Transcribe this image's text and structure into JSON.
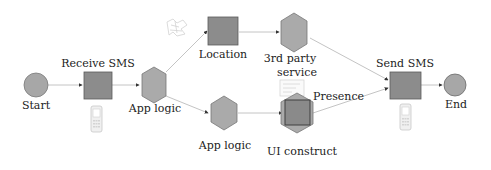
{
  "colors": {
    "node_fill": "#a9a9a9",
    "node_stroke": "#6e6e6e",
    "square_fill": "#8a8a8a",
    "square_stroke": "#555555",
    "edge": "#bfbfbf",
    "text": "#222222"
  },
  "nodes": {
    "start": {
      "label": "Start",
      "shape": "circle"
    },
    "receive_sms": {
      "label": "Receive SMS",
      "shape": "square",
      "icon": "mobile-phone-icon"
    },
    "app_logic_1": {
      "label": "App logic",
      "shape": "hexagon"
    },
    "location": {
      "label": "Location",
      "shape": "square",
      "icon": "map-icon"
    },
    "third_party": {
      "label_line1": "3rd party",
      "label_line2": "service",
      "shape": "hexagon"
    },
    "app_logic_2": {
      "label": "App logic",
      "shape": "hexagon"
    },
    "ui_construct": {
      "label": "UI construct",
      "shape": "hexagon-with-square",
      "annotation": "Presence",
      "icon": "presence-card-icon"
    },
    "send_sms": {
      "label": "Send SMS",
      "shape": "square",
      "icon": "mobile-phone-icon"
    },
    "end": {
      "label": "End",
      "shape": "circle"
    }
  },
  "edges": [
    {
      "from": "start",
      "to": "receive_sms"
    },
    {
      "from": "receive_sms",
      "to": "app_logic_1"
    },
    {
      "from": "app_logic_1",
      "to": "location"
    },
    {
      "from": "app_logic_1",
      "to": "app_logic_2"
    },
    {
      "from": "location",
      "to": "third_party"
    },
    {
      "from": "app_logic_2",
      "to": "ui_construct"
    },
    {
      "from": "third_party",
      "to": "send_sms"
    },
    {
      "from": "ui_construct",
      "to": "send_sms"
    },
    {
      "from": "send_sms",
      "to": "end"
    }
  ]
}
